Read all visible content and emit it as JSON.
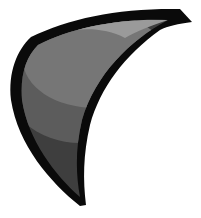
{
  "graphic": {
    "subject": "claw-crescent-shape",
    "colors": {
      "background": "#ffffff",
      "outline": "#0a0a0a",
      "fill_base": "#3e3e3e",
      "fill_mid": "#5c5c5c",
      "fill_light": "#767676",
      "highlight_streak": "#9a9a9a"
    }
  }
}
